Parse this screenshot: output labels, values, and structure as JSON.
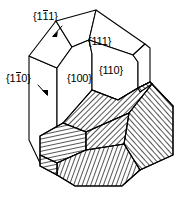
{
  "figure": {
    "background_color": "#ffffff",
    "line_color": "#000000",
    "width": 192,
    "height": 197
  },
  "labels": {
    "face_1bar11": {
      "open": "{",
      "d1": "1",
      "d2": "1",
      "d2_overbar": true,
      "d3": "1",
      "close": "}"
    },
    "face_111": {
      "open": "{",
      "d1": "1",
      "d2": "1",
      "d2_overbar": false,
      "d3": "1",
      "close": "}"
    },
    "face_110": {
      "open": "{",
      "d1": "1",
      "d2": "1",
      "d2_overbar": false,
      "d3": "0",
      "close": "}"
    },
    "face_100": {
      "open": "{",
      "d1": "1",
      "d2": "0",
      "d2_overbar": false,
      "d3": "0",
      "close": "}"
    },
    "face_1bar10": {
      "open": "{",
      "d1": "1",
      "d2": "1",
      "d2_overbar": true,
      "d3": "0",
      "close": "}"
    }
  },
  "label_names": {
    "face_1bar11": "{1̅1}",
    "face_111": "{111}",
    "face_110": "{110}",
    "face_100": "{100}",
    "face_1bar10": "{1̅0}"
  }
}
